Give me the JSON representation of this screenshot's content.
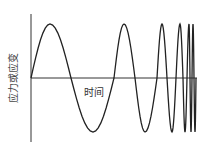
{
  "diagram": {
    "title": "",
    "ylabel": "应力或应变",
    "xlabel": "时间",
    "colors": {
      "stroke": "#222222",
      "axis": "#333333",
      "background": "#ffffff"
    },
    "axes": {
      "origin": [
        31,
        78
      ],
      "y_top": 14,
      "y_bottom": 142,
      "x_end": 196
    },
    "wave": {
      "amplitude_px": 54,
      "peaks_x": [
        50,
        124,
        162,
        180,
        189,
        193
      ],
      "troughs_x": [
        93,
        145,
        172,
        185,
        191,
        195
      ]
    }
  }
}
